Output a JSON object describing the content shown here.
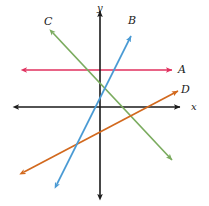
{
  "figure": {
    "width": 209,
    "height": 206,
    "background": "#ffffff"
  },
  "axes": {
    "color": "#1a1a1a",
    "x_axis": {
      "label": "x",
      "label_x": 191,
      "label_y": 101,
      "y_pixel": 107,
      "x_start": 18,
      "x_end": 180,
      "arrows": "both"
    },
    "y_axis": {
      "label": "y",
      "label_x": 97,
      "label_y": 2,
      "x_pixel": 100,
      "y_start": 11,
      "y_end": 195,
      "arrows": "both"
    },
    "origin": {
      "x": 100,
      "y": 107
    }
  },
  "chart_data": {
    "type": "line",
    "title": "",
    "xlabel": "x",
    "ylabel": "y",
    "grid": false,
    "legend": "inline-endpoint-labels",
    "series": [
      {
        "name": "A",
        "label": "A",
        "color": "#e0305e",
        "arrows": "both",
        "slope_sign": "zero",
        "description": "horizontal line above the x-axis",
        "pixel_points": [
          [
            26,
            70
          ],
          [
            172,
            70
          ]
        ],
        "label_pos": {
          "x": 178,
          "y": 64
        }
      },
      {
        "name": "B",
        "label": "B",
        "color": "#4a9ad4",
        "arrows": "both",
        "slope_sign": "positive-steep",
        "description": "steep positive slope line rising left to right",
        "pixel_points": [
          [
            57,
            184
          ],
          [
            131,
            36
          ]
        ],
        "label_pos": {
          "x": 128,
          "y": 15
        }
      },
      {
        "name": "C",
        "label": "C",
        "color": "#7aab5e",
        "arrows": "both",
        "slope_sign": "negative",
        "description": "negative slope line falling left to right",
        "pixel_points": [
          [
            53,
            33
          ],
          [
            172,
            160
          ]
        ],
        "label_pos": {
          "x": 44,
          "y": 16
        }
      },
      {
        "name": "D",
        "label": "D",
        "color": "#d2691e",
        "arrows": "both",
        "slope_sign": "positive-shallow",
        "description": "shallow positive slope line rising left to right",
        "pixel_points": [
          [
            24,
            172
          ],
          [
            178,
            91
          ]
        ],
        "label_pos": {
          "x": 181,
          "y": 84
        }
      }
    ]
  }
}
